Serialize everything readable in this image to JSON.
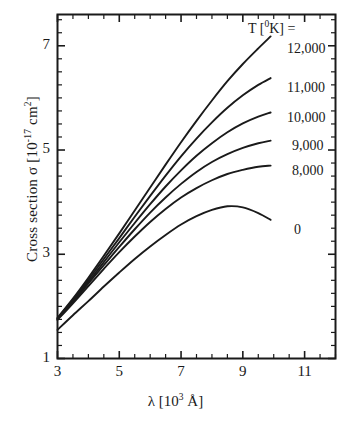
{
  "chart_data": {
    "type": "line",
    "title": "",
    "xlabel": "λ [10³ Å]",
    "ylabel": "Cross section σ [10⁻¹⁷ cm²]",
    "xlim": [
      3,
      12
    ],
    "ylim": [
      1,
      7.6
    ],
    "xticks": [
      3,
      5,
      7,
      9,
      11
    ],
    "xtick_labels": [
      "3",
      "5",
      "7",
      "9",
      "11"
    ],
    "yticks": [
      1,
      3,
      5,
      7
    ],
    "ytick_labels": [
      "1",
      "3",
      "5",
      "7"
    ],
    "minor_tick_step_x": 0.5,
    "minor_tick_step_y": 0.25,
    "grid": false,
    "legend_position": "right-inside",
    "legend_title": "T [⁰K] =",
    "frame": "box",
    "series": [
      {
        "name": "12,000",
        "label": "12,000",
        "color": "#1a1a1a",
        "x": [
          3.0,
          3.5,
          4.0,
          4.5,
          5.0,
          5.5,
          6.0,
          6.5,
          7.0,
          7.5,
          8.0,
          8.5,
          9.0,
          9.5,
          9.9
        ],
        "y": [
          1.78,
          2.15,
          2.55,
          2.97,
          3.4,
          3.84,
          4.28,
          4.72,
          5.15,
          5.56,
          5.95,
          6.32,
          6.65,
          6.95,
          7.18
        ]
      },
      {
        "name": "11,000",
        "label": "11,000",
        "color": "#1a1a1a",
        "x": [
          3.0,
          3.5,
          4.0,
          4.5,
          5.0,
          5.5,
          6.0,
          6.5,
          7.0,
          7.5,
          8.0,
          8.5,
          9.0,
          9.5,
          9.9
        ],
        "y": [
          1.77,
          2.13,
          2.51,
          2.91,
          3.31,
          3.72,
          4.12,
          4.51,
          4.88,
          5.22,
          5.53,
          5.81,
          6.05,
          6.25,
          6.38
        ]
      },
      {
        "name": "10,000",
        "label": "10,000",
        "color": "#1a1a1a",
        "x": [
          3.0,
          3.5,
          4.0,
          4.5,
          5.0,
          5.5,
          6.0,
          6.5,
          7.0,
          7.5,
          8.0,
          8.5,
          9.0,
          9.5,
          9.9
        ],
        "y": [
          1.76,
          2.11,
          2.47,
          2.85,
          3.23,
          3.6,
          3.96,
          4.3,
          4.61,
          4.89,
          5.13,
          5.34,
          5.51,
          5.64,
          5.72
        ]
      },
      {
        "name": "9,000",
        "label": "9,000",
        "color": "#1a1a1a",
        "x": [
          3.0,
          3.5,
          4.0,
          4.5,
          5.0,
          5.5,
          6.0,
          6.5,
          7.0,
          7.5,
          8.0,
          8.5,
          9.0,
          9.5,
          9.9
        ],
        "y": [
          1.75,
          2.09,
          2.44,
          2.79,
          3.14,
          3.48,
          3.8,
          4.09,
          4.35,
          4.58,
          4.77,
          4.92,
          5.04,
          5.13,
          5.18
        ]
      },
      {
        "name": "8,000",
        "label": "8,000",
        "color": "#1a1a1a",
        "x": [
          3.0,
          3.5,
          4.0,
          4.5,
          5.0,
          5.5,
          6.0,
          6.5,
          7.0,
          7.5,
          8.0,
          8.5,
          9.0,
          9.5,
          9.9
        ],
        "y": [
          1.74,
          2.06,
          2.39,
          2.72,
          3.04,
          3.34,
          3.62,
          3.87,
          4.09,
          4.27,
          4.42,
          4.54,
          4.62,
          4.68,
          4.7
        ]
      },
      {
        "name": "0",
        "label": "0",
        "color": "#1a1a1a",
        "x": [
          3.0,
          3.5,
          4.0,
          4.5,
          5.0,
          5.5,
          6.0,
          6.5,
          7.0,
          7.5,
          8.0,
          8.5,
          9.0,
          9.5,
          9.9
        ],
        "y": [
          1.55,
          1.83,
          2.1,
          2.38,
          2.65,
          2.91,
          3.15,
          3.37,
          3.57,
          3.73,
          3.85,
          3.92,
          3.9,
          3.79,
          3.66
        ]
      }
    ],
    "legend_entries": [
      {
        "label": "12,000",
        "x": 287,
        "y": 41
      },
      {
        "label": "11,000",
        "x": 287,
        "y": 80
      },
      {
        "label": "10,000",
        "x": 287,
        "y": 110
      },
      {
        "label": "9,000",
        "x": 292,
        "y": 138
      },
      {
        "label": "8,000",
        "x": 292,
        "y": 163
      },
      {
        "label": "0",
        "x": 294,
        "y": 222
      }
    ]
  }
}
